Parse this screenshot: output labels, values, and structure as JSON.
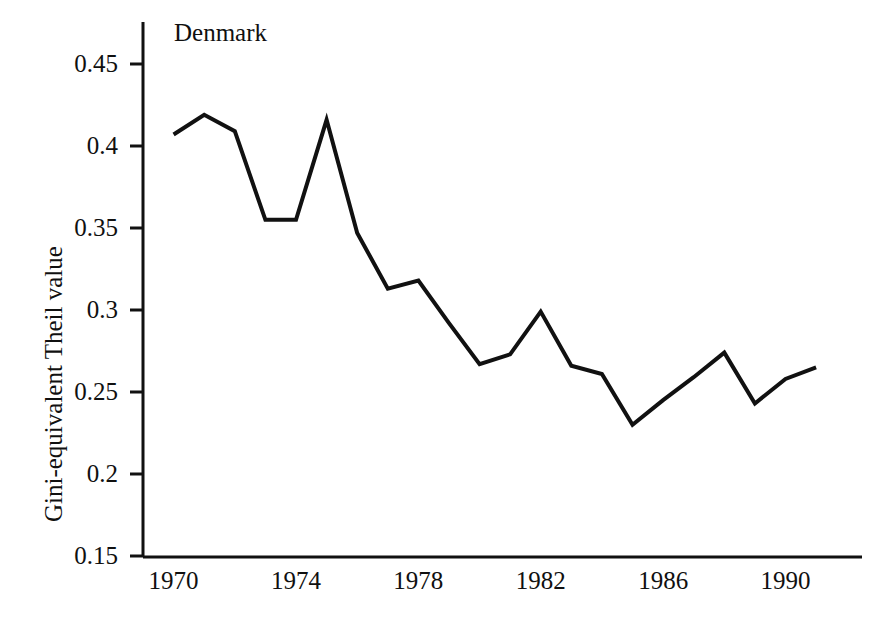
{
  "figure": {
    "width": 886,
    "height": 624,
    "background": "#ffffff",
    "line_color": "#111111",
    "axis_color": "#111111"
  },
  "series_label": "Denmark",
  "axes": {
    "y_title": "Gini-equivalent Theil value",
    "x_title": "",
    "y_ticks": [
      "0.15",
      "0.2",
      "0.25",
      "0.3",
      "0.35",
      "0.4",
      "0.45"
    ],
    "x_ticks": [
      "1970",
      "1974",
      "1978",
      "1982",
      "1986",
      "1990"
    ]
  },
  "chart_data": {
    "type": "line",
    "title": "",
    "subtitle": "",
    "xlabel": "",
    "ylabel": "Gini-equivalent Theil value",
    "xlim": [
      1969.0,
      1992.5
    ],
    "ylim": [
      0.15,
      0.465
    ],
    "grid": false,
    "legend": "none",
    "annotations": [
      "Denmark"
    ],
    "xticks": [
      1970,
      1974,
      1978,
      1982,
      1986,
      1990
    ],
    "yticks": [
      0.15,
      0.2,
      0.25,
      0.3,
      0.35,
      0.4,
      0.45
    ],
    "x": [
      1970,
      1971,
      1972,
      1973,
      1974,
      1975,
      1976,
      1977,
      1978,
      1979,
      1980,
      1981,
      1982,
      1983,
      1984,
      1985,
      1986,
      1987,
      1988,
      1989,
      1990,
      1991
    ],
    "series": [
      {
        "name": "Denmark",
        "color": "#111111",
        "values": [
          0.407,
          0.419,
          0.409,
          0.355,
          0.355,
          0.416,
          0.347,
          0.313,
          0.318,
          0.292,
          0.267,
          0.273,
          0.299,
          0.266,
          0.261,
          0.23,
          0.245,
          0.259,
          0.274,
          0.243,
          0.258,
          0.265
        ]
      }
    ]
  }
}
